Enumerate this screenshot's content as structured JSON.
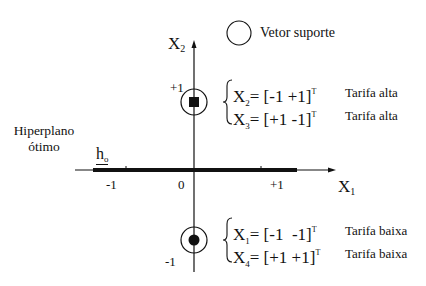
{
  "diagram": {
    "axes": {
      "x": {
        "name": "X",
        "subscript": "1",
        "ticks": [
          "-1",
          "0",
          "+1"
        ]
      },
      "y": {
        "name": "X",
        "subscript": "2",
        "ticks": [
          "+1",
          "-1"
        ]
      }
    },
    "legend": {
      "symbol": "circle",
      "label": "Vetor suporte"
    },
    "hyperplane": {
      "label_line1": "Hiperplano",
      "label_line2": "ótimo",
      "symbol": "h",
      "symbol_subscript": "o"
    },
    "groups": [
      {
        "name": "upper",
        "marker": "square",
        "position_label": "+1",
        "vectors": [
          {
            "name": "X",
            "sub": "2",
            "value": "= [-1 +1]",
            "sup": "T",
            "class_label": "Tarifa alta"
          },
          {
            "name": "X",
            "sub": "3",
            "value": "= [+1 -1]",
            "sup": "T",
            "class_label": "Tarifa alta"
          }
        ]
      },
      {
        "name": "lower",
        "marker": "dot",
        "position_label": "-1",
        "vectors": [
          {
            "name": "X",
            "sub": "1",
            "value": "= [-1  -1]",
            "sup": "T",
            "class_label": "Tarifa baixa"
          },
          {
            "name": "X",
            "sub": "4",
            "value": "= [+1 +1]",
            "sup": "T",
            "class_label": "Tarifa baixa"
          }
        ]
      }
    ],
    "colors": {
      "ink": "#111111",
      "background": "#ffffff"
    }
  }
}
